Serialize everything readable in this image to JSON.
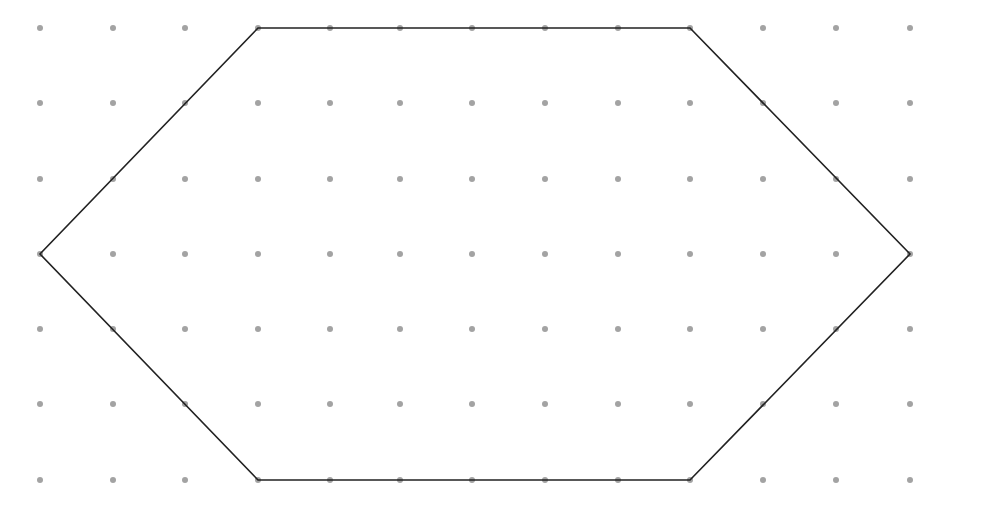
{
  "diagram": {
    "type": "dot-grid-polygon",
    "grid": {
      "columns": 13,
      "rows": 7,
      "x_positions": [
        40,
        113,
        185,
        258,
        330,
        400,
        472,
        545,
        618,
        690,
        763,
        836,
        910
      ],
      "y_positions": [
        28,
        103,
        179,
        254,
        329,
        404,
        480
      ],
      "dot_color": "#a3a3a3",
      "dot_radius": 3
    },
    "polygon": {
      "shape": "hexagon",
      "vertices_grid": [
        [
          3,
          0
        ],
        [
          9,
          0
        ],
        [
          12,
          3
        ],
        [
          9,
          6
        ],
        [
          3,
          6
        ],
        [
          0,
          3
        ]
      ],
      "stroke_color": "#222222",
      "stroke_width": 1.6
    }
  }
}
